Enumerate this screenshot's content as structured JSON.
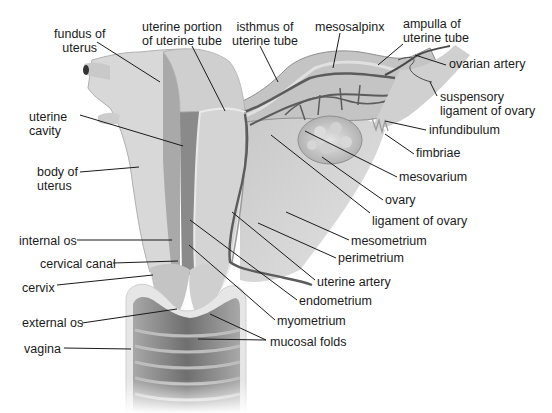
{
  "diagram": {
    "labels": [
      {
        "id": "fundus",
        "text": "fundus of\nuterus",
        "x": 54,
        "y": 27,
        "align": "center",
        "line": [
          [
            97,
            42
          ],
          [
            160,
            82
          ]
        ]
      },
      {
        "id": "uterine-portion",
        "text": "uterine portion\nof uterine tube",
        "x": 142,
        "y": 20,
        "align": "center",
        "line": [
          [
            192,
            46
          ],
          [
            225,
            111
          ]
        ]
      },
      {
        "id": "isthmus",
        "text": "isthmus of\nuterine tube",
        "x": 232,
        "y": 20,
        "align": "center",
        "line": [
          [
            260,
            46
          ],
          [
            278,
            82
          ]
        ]
      },
      {
        "id": "mesosalpinx",
        "text": "mesosalpinx",
        "x": 315,
        "y": 20,
        "align": "left",
        "line": [
          [
            340,
            33
          ],
          [
            333,
            68
          ]
        ]
      },
      {
        "id": "ampulla",
        "text": "ampulla of\nuterine tube",
        "x": 403,
        "y": 17,
        "align": "left",
        "line": [
          [
            403,
            44
          ],
          [
            378,
            65
          ]
        ]
      },
      {
        "id": "ovarian-artery",
        "text": "ovarian artery",
        "x": 449,
        "y": 57,
        "align": "left",
        "line": [
          [
            446,
            65
          ],
          [
            415,
            55
          ]
        ]
      },
      {
        "id": "suspensory",
        "text": "suspensory\nligament of ovary",
        "x": 440,
        "y": 90,
        "align": "left",
        "line": [
          [
            437,
            96
          ],
          [
            430,
            82
          ]
        ]
      },
      {
        "id": "infundibulum",
        "text": "infundibulum",
        "x": 429,
        "y": 123,
        "align": "left",
        "line": [
          [
            426,
            130
          ],
          [
            385,
            121
          ]
        ]
      },
      {
        "id": "fimbriae",
        "text": "fimbriae",
        "x": 416,
        "y": 146,
        "align": "left",
        "line": [
          [
            414,
            154
          ],
          [
            385,
            134
          ]
        ]
      },
      {
        "id": "mesovarium",
        "text": "mesovarium",
        "x": 399,
        "y": 170,
        "align": "left",
        "line": [
          [
            397,
            177
          ],
          [
            305,
            131
          ]
        ]
      },
      {
        "id": "ovary",
        "text": "ovary",
        "x": 385,
        "y": 193,
        "align": "left",
        "line": [
          [
            383,
            200
          ],
          [
            322,
            157
          ]
        ]
      },
      {
        "id": "ligament-of-ovary",
        "text": "ligament of ovary",
        "x": 372,
        "y": 214,
        "align": "left",
        "line": [
          [
            370,
            213
          ],
          [
            271,
            135
          ]
        ]
      },
      {
        "id": "mesometrium",
        "text": "mesometrium",
        "x": 351,
        "y": 234,
        "align": "left",
        "line": [
          [
            349,
            240
          ],
          [
            286,
            212
          ]
        ]
      },
      {
        "id": "perimetrium",
        "text": "perimetrium",
        "x": 338,
        "y": 251,
        "align": "left",
        "line": [
          [
            336,
            258
          ],
          [
            258,
            223
          ]
        ]
      },
      {
        "id": "uterine-artery",
        "text": "uterine artery",
        "x": 317,
        "y": 275,
        "align": "left",
        "line": [
          [
            315,
            280
          ],
          [
            232,
            212
          ]
        ]
      },
      {
        "id": "endometrium",
        "text": "endometrium",
        "x": 299,
        "y": 294,
        "align": "left",
        "line": [
          [
            297,
            300
          ],
          [
            190,
            220
          ]
        ]
      },
      {
        "id": "myometrium",
        "text": "myometrium",
        "x": 277,
        "y": 314,
        "align": "left",
        "line": [
          [
            275,
            320
          ],
          [
            189,
            245
          ]
        ]
      },
      {
        "id": "mucosal-folds",
        "text": "mucosal folds",
        "x": 270,
        "y": 335,
        "align": "left",
        "line": [
          [
            266,
            340
          ],
          [
            210,
            314
          ]
        ],
        "line2": [
          [
            266,
            340
          ],
          [
            198,
            339
          ]
        ]
      },
      {
        "id": "uterine-cavity",
        "text": "uterine\ncavity",
        "x": 29,
        "y": 110,
        "align": "left",
        "line": [
          [
            80,
            115
          ],
          [
            183,
            146
          ]
        ]
      },
      {
        "id": "body-of-uterus",
        "text": "body of\nuterus",
        "x": 37,
        "y": 165,
        "align": "left",
        "line": [
          [
            80,
            172
          ],
          [
            139,
            167
          ]
        ]
      },
      {
        "id": "internal-os",
        "text": "internal os",
        "x": 19,
        "y": 234,
        "align": "left",
        "line": [
          [
            77,
            240
          ],
          [
            172,
            240
          ]
        ]
      },
      {
        "id": "cervical-canal",
        "text": "cervical canal",
        "x": 40,
        "y": 257,
        "align": "left",
        "line": [
          [
            113,
            263
          ],
          [
            178,
            261
          ]
        ]
      },
      {
        "id": "cervix",
        "text": "cervix",
        "x": 22,
        "y": 281,
        "align": "left",
        "line": [
          [
            57,
            285
          ],
          [
            153,
            275
          ]
        ]
      },
      {
        "id": "external-os",
        "text": "external os",
        "x": 22,
        "y": 316,
        "align": "left",
        "line": [
          [
            82,
            323
          ],
          [
            177,
            309
          ]
        ]
      },
      {
        "id": "vagina",
        "text": "vagina",
        "x": 24,
        "y": 342,
        "align": "left",
        "line": [
          [
            64,
            348
          ],
          [
            131,
            349
          ]
        ]
      }
    ]
  },
  "colors": {
    "tissue_light": "#d9d9d9",
    "tissue_mid": "#bdbdbd",
    "tissue_dark": "#8a8a8a",
    "vessel": "#5c5c5c",
    "leader": "#1a1a1a",
    "text": "#1a1a1a"
  }
}
